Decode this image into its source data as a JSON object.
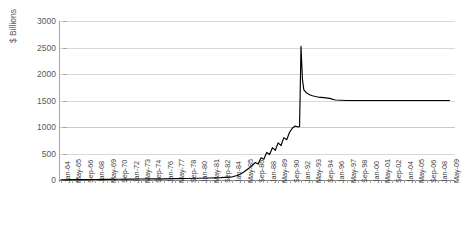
{
  "chart_data": {
    "type": "line",
    "title": "",
    "xlabel": "",
    "ylabel": "$ Billions",
    "ylim": [
      0,
      3000
    ],
    "yticks": [
      0,
      500,
      1000,
      1500,
      2000,
      2500,
      3000
    ],
    "grid": true,
    "legend": false,
    "series_color": "#000000",
    "gridline_color": "#d9d9d9",
    "axis_color": "#a6a6a6",
    "categories": [
      "Jan-64",
      "May-65",
      "Sep-66",
      "Jan-68",
      "May-69",
      "Sep-70",
      "Jan-72",
      "May-73",
      "Sep-74",
      "Jan-76",
      "May-77",
      "Sep-78",
      "Jan-80",
      "May-81",
      "Sep-82",
      "Jan-84",
      "May-85",
      "Sep-86",
      "Jan-88",
      "May-89",
      "Sep-90",
      "Jan-92",
      "May-93",
      "Sep-94",
      "Jan-96",
      "May-97",
      "Sep-98",
      "Jan-00",
      "May-01",
      "Sep-02",
      "Jan-04",
      "May-05",
      "Sep-06",
      "Jan-08",
      "May-09"
    ],
    "series": [
      {
        "name": "series-1",
        "x": [
          "Jan-64",
          "May-65",
          "Sep-66",
          "Jan-68",
          "May-69",
          "Sep-70",
          "Jan-72",
          "May-73",
          "Sep-74",
          "Jan-76",
          "May-77",
          "Sep-78",
          "Jan-80",
          "May-81",
          "Sep-82",
          "Jan-84",
          "Sep-84",
          "May-85",
          "Jan-86",
          "Sep-86",
          "Jan-87",
          "May-87",
          "Sep-87",
          "Jan-88",
          "May-88",
          "Sep-88",
          "Jan-89",
          "May-89",
          "Sep-89",
          "Jan-90",
          "May-90",
          "Sep-90",
          "Jan-91",
          "May-91",
          "Sep-91",
          "Nov-91",
          "Jan-92",
          "Mar-92",
          "May-92",
          "Sep-92",
          "Jan-93",
          "May-93",
          "Sep-93",
          "Jan-94",
          "Sep-94",
          "May-95",
          "Jan-96",
          "May-97",
          "Sep-98",
          "Jan-00",
          "May-01",
          "Sep-02",
          "Jan-04",
          "May-05",
          "Sep-06",
          "Jan-08",
          "May-09"
        ],
        "values": [
          5,
          6,
          8,
          10,
          12,
          14,
          16,
          18,
          20,
          22,
          25,
          28,
          32,
          38,
          45,
          60,
          90,
          150,
          230,
          330,
          300,
          420,
          390,
          520,
          480,
          610,
          560,
          700,
          650,
          800,
          760,
          900,
          980,
          1020,
          1000,
          1010,
          2520,
          1900,
          1700,
          1640,
          1610,
          1590,
          1575,
          1565,
          1555,
          1540,
          1510,
          1500,
          1500,
          1500,
          1500,
          1500,
          1500,
          1500,
          1500,
          1500,
          1500
        ]
      }
    ],
    "annotations": {
      "peak_value": 2500,
      "peak_label": "Jan-92",
      "plateau_value": 1500
    }
  },
  "axis": {
    "y_title": "$ Billions"
  }
}
